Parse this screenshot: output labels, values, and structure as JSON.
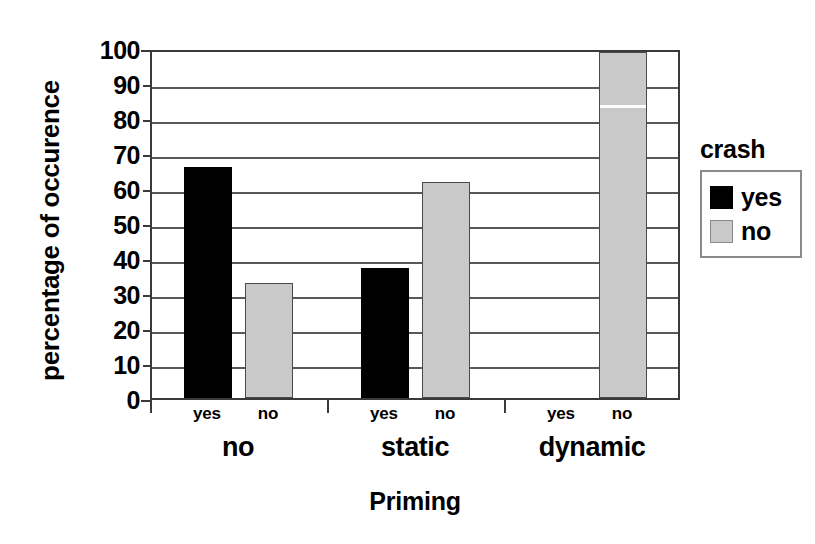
{
  "chart_data": {
    "type": "bar",
    "title": "",
    "xlabel": "Priming",
    "ylabel": "percentage of occurence",
    "ylim": [
      0,
      100
    ],
    "ytick_step": 10,
    "yticks": [
      "100",
      "90",
      "80",
      "70",
      "60",
      "50",
      "40",
      "30",
      "20",
      "10",
      "0"
    ],
    "grid": true,
    "grouped": true,
    "categories": [
      "no",
      "static",
      "dynamic"
    ],
    "subcategories": [
      "yes",
      "no"
    ],
    "legend": {
      "title": "crash",
      "position": "right",
      "entries": [
        {
          "label": "yes",
          "color": "#000000"
        },
        {
          "label": "no",
          "color": "#c9c9c9"
        }
      ]
    },
    "series": [
      {
        "name": "yes",
        "color": "#000000",
        "values": [
          66.7,
          37.5,
          0
        ]
      },
      {
        "name": "no",
        "color": "#c9c9c9",
        "values": [
          33.3,
          62.5,
          100
        ]
      }
    ],
    "bars": [
      {
        "group": "no",
        "sub": "yes",
        "series": "yes",
        "value": 66.7
      },
      {
        "group": "no",
        "sub": "no",
        "series": "no",
        "value": 33.3
      },
      {
        "group": "static",
        "sub": "yes",
        "series": "yes",
        "value": 37.5
      },
      {
        "group": "static",
        "sub": "no",
        "series": "no",
        "value": 62.5
      },
      {
        "group": "dynamic",
        "sub": "yes",
        "series": "yes",
        "value": 0
      },
      {
        "group": "dynamic",
        "sub": "no",
        "series": "no",
        "value": 100
      }
    ],
    "group_sublabels": [
      {
        "group": "no",
        "labels": [
          "yes",
          "no"
        ]
      },
      {
        "group": "static",
        "labels": [
          "yes",
          "no"
        ]
      },
      {
        "group": "dynamic",
        "labels": [
          "yes",
          "no"
        ]
      }
    ]
  }
}
